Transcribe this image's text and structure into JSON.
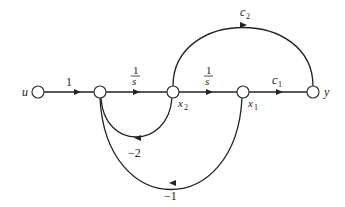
{
  "diagram": {
    "type": "signal-flow-graph",
    "nodes": [
      {
        "id": "u",
        "label": "u",
        "x": 38,
        "y": 92
      },
      {
        "id": "n1",
        "label": "",
        "x": 100,
        "y": 92
      },
      {
        "id": "x2",
        "label": "x",
        "sub": "2",
        "x": 173,
        "y": 92
      },
      {
        "id": "x1",
        "label": "x",
        "sub": "1",
        "x": 243,
        "y": 92
      },
      {
        "id": "y",
        "label": "y",
        "x": 313,
        "y": 92
      }
    ],
    "edges": [
      {
        "from": "u",
        "to": "n1",
        "gain": "1"
      },
      {
        "from": "n1",
        "to": "x2",
        "gain_num": "1",
        "gain_den": "s"
      },
      {
        "from": "x2",
        "to": "x1",
        "gain_num": "1",
        "gain_den": "s"
      },
      {
        "from": "x1",
        "to": "y",
        "gain": "c",
        "gain_sub": "1"
      },
      {
        "from": "x2",
        "to": "y",
        "gain": "c",
        "gain_sub": "2"
      },
      {
        "from": "x2",
        "to": "n1",
        "gain": "−2"
      },
      {
        "from": "x1",
        "to": "n1",
        "gain": "−1"
      }
    ]
  },
  "labels": {
    "u": "u",
    "y": "y",
    "x": "x",
    "x2_sub": "2",
    "x1_sub": "1",
    "gain_u_n1": "1",
    "gain_frac_num": "1",
    "gain_frac_den": "s",
    "c": "c",
    "c1_sub": "1",
    "c2_sub": "2",
    "fb_minus2": "−2",
    "fb_minus1": "−1"
  }
}
